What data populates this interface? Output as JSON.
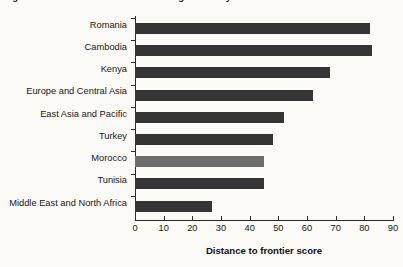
{
  "figure": {
    "caption": "Figure 3.3  Distance to Frontier in Getting Electricity"
  },
  "chart_data": {
    "type": "bar",
    "orientation": "horizontal",
    "title": "Figure 3.3  Distance to Frontier in Getting Electricity",
    "xlabel": "Distance to frontier score",
    "ylabel": "",
    "xlim": [
      0,
      90
    ],
    "xticks": [
      0,
      10,
      20,
      30,
      40,
      50,
      60,
      70,
      80,
      90
    ],
    "grid": false,
    "legend": null,
    "categories": [
      "Romania",
      "Cambodia",
      "Kenya",
      "Europe and Central Asia",
      "East Asia and Pacific",
      "Turkey",
      "Morocco",
      "Tunisia",
      "Middle East and North Africa"
    ],
    "values": [
      82,
      82.5,
      68,
      62,
      52,
      48,
      45,
      45,
      27
    ],
    "bar_colors": [
      "#353535",
      "#353535",
      "#353535",
      "#353535",
      "#353535",
      "#353535",
      "#6d6d6d",
      "#353535",
      "#353535"
    ],
    "highlight_category": "Morocco",
    "colors": {
      "bar_default": "#353535",
      "bar_highlight": "#6d6d6d",
      "axis": "#2b2b2b",
      "background": "#fbfaf6",
      "text": "#161616"
    }
  },
  "axis": {
    "x_title": "Distance to frontier score",
    "x_tick_labels": [
      "0",
      "10",
      "20",
      "30",
      "40",
      "50",
      "60",
      "70",
      "80",
      "90"
    ]
  }
}
